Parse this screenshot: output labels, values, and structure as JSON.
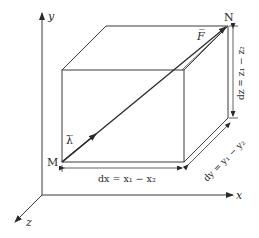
{
  "diagram": {
    "axes": {
      "x_label": "x",
      "y_label": "y",
      "z_label": "z"
    },
    "points": {
      "start": "M",
      "end": "N"
    },
    "vectors": {
      "force": "F̅",
      "unit": "λ̅"
    },
    "dimensions": {
      "dx": "dx = x₁ − x₂",
      "dy": "dy = y₁ − y₂",
      "dz": "dz = z₁ − z₂"
    },
    "colors": {
      "line": "#3a3a3a",
      "text": "#2a2a2a"
    }
  }
}
